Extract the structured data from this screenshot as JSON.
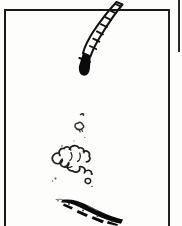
{
  "document": {
    "kind": "comic-panel-scan",
    "width": 226,
    "height": 226,
    "background_color": "#ffffff",
    "ink_color": "#111111",
    "paper_color": "#fdfdfc",
    "caption_text": "",
    "dialogue_text": ""
  },
  "panel": {
    "border_color": "#1a1a1a",
    "border_thickness_px": 2,
    "left_px": 4,
    "top_px": 9,
    "right_px": 170,
    "bottom_px": 226,
    "adjacent_panel_edge_x_px": 179
  },
  "artwork": {
    "title": "",
    "elements": [
      {
        "name": "ladder-strip",
        "label": "segmented ladder strip",
        "description": "diagonal segmented band entering from upper right with black rounded tip at lower end",
        "ink": "#111111",
        "rung_count": 8,
        "tip_shape": "solid-black-rounded"
      },
      {
        "name": "smoke-cloud",
        "label": "outlined smoke puff cluster",
        "description": "cluster of open-outline puffs in mid panel",
        "ink": "#222222",
        "puff_count": 9
      },
      {
        "name": "cloud-wisp-upper",
        "label": "small detached wisp",
        "description": "tiny outlined puff above main cluster",
        "ink": "#333333"
      },
      {
        "name": "speck-marks",
        "label": "stray ink specks",
        "description": "scattered small dots around the cloud",
        "ink": "#555555",
        "speck_count": 5
      },
      {
        "name": "ground-streak",
        "label": "dark diagonal streak",
        "description": "rough black brush streak descending left-to-right across the bottom",
        "ink": "#000000"
      }
    ]
  }
}
